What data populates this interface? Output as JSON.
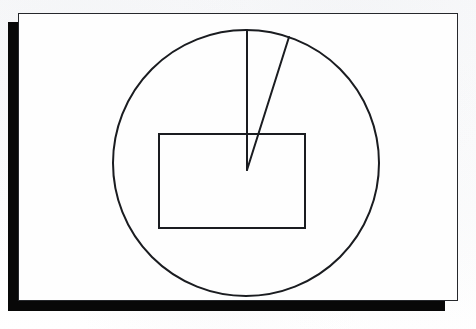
{
  "page": {
    "background_color": "#fdfdfd",
    "paper_color": "#fefefe",
    "ink_color": "#1a1c20",
    "shadow_color": "#080808",
    "width": 476,
    "height": 329,
    "top_crumb_text": "",
    "frame": {
      "x": 18,
      "y": 13,
      "width": 440,
      "height": 288,
      "border_width": 1.6
    },
    "shadow": {
      "left_bar": {
        "x": 8,
        "y": 22,
        "width": 11,
        "height": 289
      },
      "bottom_bar": {
        "x": 8,
        "y": 300,
        "width": 437,
        "height": 11
      }
    }
  },
  "figure": {
    "type": "geometric-diagram",
    "stroke_color": "#1a1c20",
    "fill": "none",
    "shapes": [
      {
        "name": "circle",
        "kind": "circle",
        "center_x": 246,
        "center_y": 163,
        "radius": 133,
        "stroke_width": 2.0,
        "label": "Circle"
      },
      {
        "name": "rectangle",
        "kind": "rect",
        "x": 159,
        "y": 134,
        "width": 146,
        "height": 94,
        "stroke_width": 2.0,
        "label": "Inscribed rectangle"
      },
      {
        "name": "radius-vertical",
        "kind": "line",
        "x1": 247,
        "y1": 163,
        "x2": 247,
        "y2": 30,
        "stroke_width": 2.0,
        "label": "Vertical radius"
      },
      {
        "name": "radius-slanted",
        "kind": "line",
        "x1": 247,
        "y1": 170,
        "x2": 289,
        "y2": 37,
        "stroke_width": 2.0,
        "label": "Slanted radius"
      }
    ],
    "sector": {
      "name": "sector-wedge",
      "vertex_x": 247,
      "vertex_y": 167,
      "start_angle_deg": 90,
      "end_angle_deg": 72,
      "label": "Narrow sector between the two radii"
    }
  }
}
